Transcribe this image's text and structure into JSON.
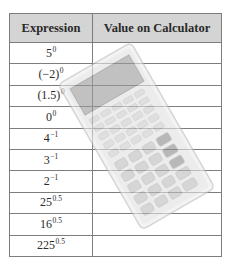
{
  "table": {
    "headers": [
      "Expression",
      "Value on Calculator"
    ],
    "rows": [
      {
        "base": "5",
        "exp": "0",
        "value": ""
      },
      {
        "base": "(−2)",
        "exp": "0",
        "value": ""
      },
      {
        "base": "(1.5)",
        "exp": "0",
        "value": ""
      },
      {
        "base": "0",
        "exp": "0",
        "value": ""
      },
      {
        "base": "4",
        "exp": "−1",
        "value": ""
      },
      {
        "base": "3",
        "exp": "−1",
        "value": ""
      },
      {
        "base": "2",
        "exp": "−1",
        "value": ""
      },
      {
        "base": "25",
        "exp": "0.5",
        "value": ""
      },
      {
        "base": "16",
        "exp": "0.5",
        "value": ""
      },
      {
        "base": "225",
        "exp": "0.5",
        "value": ""
      }
    ]
  },
  "illustration": {
    "icon": "calculator-icon",
    "colors": {
      "body": "#e6e6e6",
      "screen": "#9c9c9c",
      "keys": "#c8c8c8",
      "dark_keys": "#8c8c8c"
    }
  }
}
